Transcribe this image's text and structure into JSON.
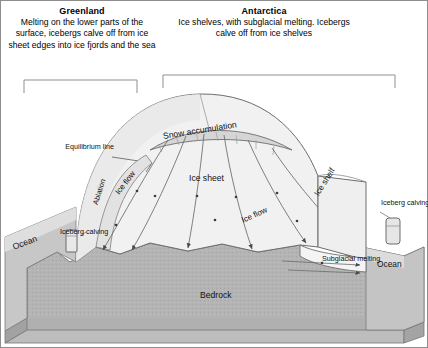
{
  "headers": {
    "greenland": {
      "title": "Greenland",
      "body": "Melting on the lower parts of the surface, icebergs calve off from ice sheet edges into ice fjords and the sea"
    },
    "antarctica": {
      "title": "Antarctica",
      "body": "Ice shelves, with subglacial melting. Icebergs calve off from ice shelves"
    }
  },
  "labels": {
    "equilibrium_line": "Equilibrium line",
    "snow_accumulation": "Snow accumulation",
    "ice_sheet": "Ice sheet",
    "ice_flow_left": "Ice flow",
    "ice_flow_right": "Ice flow",
    "ablation": "Ablation",
    "ice_shelf": "Ice shelf",
    "ocean_left": "Ocean",
    "ocean_right": "Ocean",
    "iceberg_calving_left": "Iceberg calving",
    "iceberg_calving_right": "Iceberg calving",
    "subglacial_melting": "Subglacial melting",
    "bedrock": "Bedrock"
  },
  "colors": {
    "bedrock_fill": "#b4b4b4",
    "bedrock_top": "#c9c9c9",
    "bedrock_side": "#a8a8a8",
    "ocean_fill": "#b9b9b9",
    "ice_fill": "#f2f2f2",
    "ice_dome_fill": "#ececec",
    "snow_band_fill": "#d8d8d8",
    "shelf_fill": "#efefef",
    "iceberg_fill": "#e4e4e4",
    "stroke": "#555555",
    "text": "#111111"
  }
}
